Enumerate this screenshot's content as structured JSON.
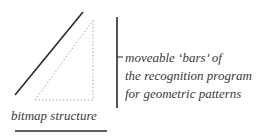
{
  "diagram": {
    "caption_right": [
      "moveable ‘bars’ of",
      "the recognition program",
      "for geometric patterns"
    ],
    "caption_bottom": "bitmap structure",
    "colors": {
      "line": "#2a2a2a",
      "dotted": "#a8a8a8",
      "text": "#3a3a3a",
      "background": "#ffffff"
    }
  }
}
